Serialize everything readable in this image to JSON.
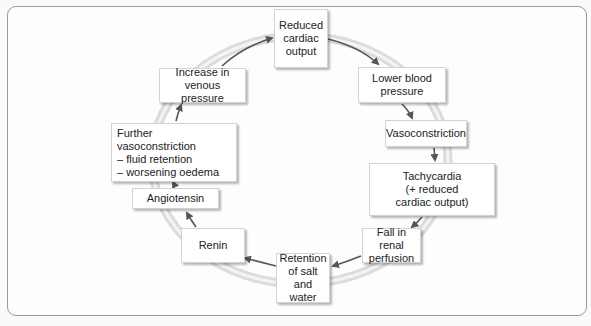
{
  "diagram": {
    "type": "cycle",
    "nodes": [
      {
        "id": "reduced-cardiac-output",
        "label": "Reduced\ncardiac\noutput"
      },
      {
        "id": "lower-blood-pressure",
        "label": "Lower blood\npressure"
      },
      {
        "id": "vasoconstriction",
        "label": "Vasoconstriction"
      },
      {
        "id": "tachycardia",
        "label": "Tachycardia\n(+ reduced\ncardiac output)"
      },
      {
        "id": "fall-in-renal-perfusion",
        "label": "Fall in renal\nperfusion"
      },
      {
        "id": "retention-salt-water",
        "label": "Retention\nof salt\nand water"
      },
      {
        "id": "renin",
        "label": "Renin"
      },
      {
        "id": "angiotensin",
        "label": "Angiotensin"
      },
      {
        "id": "further-vasoconstriction",
        "label": "Further vasoconstriction\n– fluid retention\n– worsening oedema"
      },
      {
        "id": "increase-venous-pressure",
        "label": "Increase in\nvenous pressure"
      }
    ],
    "edges": [
      [
        "reduced-cardiac-output",
        "lower-blood-pressure"
      ],
      [
        "lower-blood-pressure",
        "vasoconstriction"
      ],
      [
        "vasoconstriction",
        "tachycardia"
      ],
      [
        "tachycardia",
        "fall-in-renal-perfusion"
      ],
      [
        "fall-in-renal-perfusion",
        "retention-salt-water"
      ],
      [
        "retention-salt-water",
        "renin"
      ],
      [
        "renin",
        "angiotensin"
      ],
      [
        "angiotensin",
        "further-vasoconstriction"
      ],
      [
        "further-vasoconstriction",
        "increase-venous-pressure"
      ],
      [
        "increase-venous-pressure",
        "reduced-cardiac-output"
      ]
    ],
    "direction": "clockwise",
    "colors": {
      "ring": "#d9d9d9",
      "arrow": "#555555",
      "box_border": "#d3d3d3",
      "frame": "#9a9a9a"
    }
  }
}
